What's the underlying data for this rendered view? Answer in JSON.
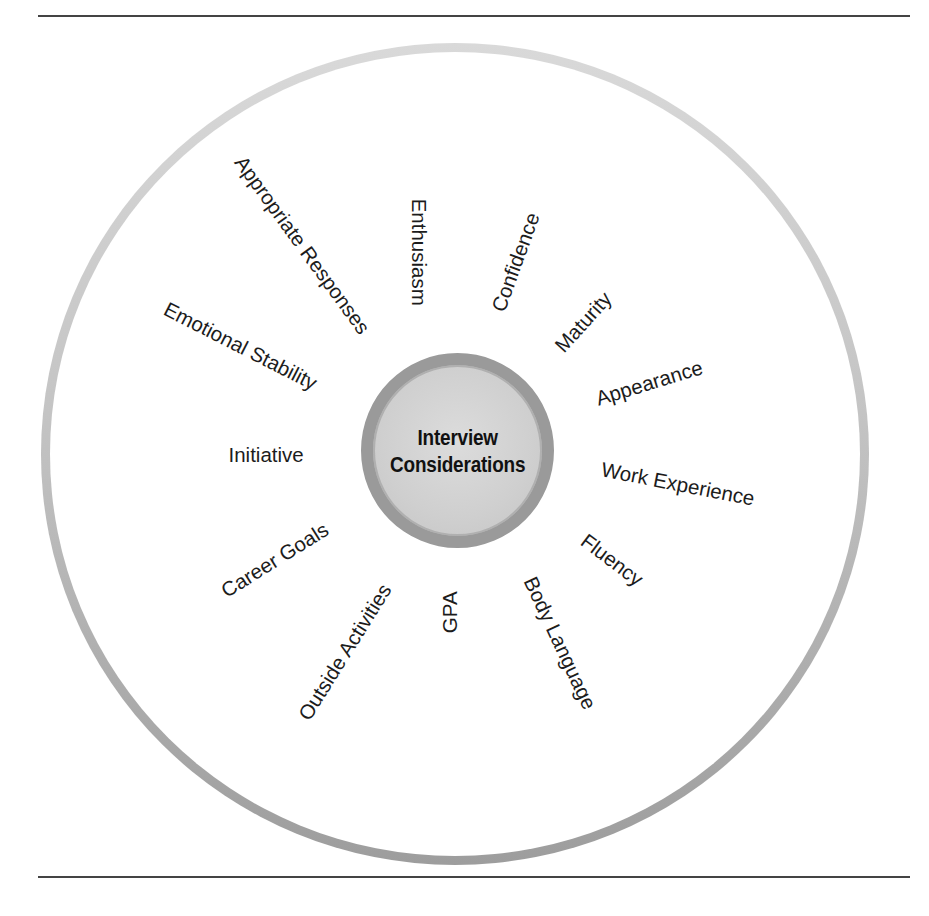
{
  "figure": {
    "caption_clipped": true,
    "hub": {
      "line1": "Interview",
      "line2": "Considerations"
    },
    "factors": [
      {
        "label": "Appropriate Responses",
        "cx": 302,
        "cy": 245,
        "angle": 54
      },
      {
        "label": "Enthusiasm",
        "cx": 418,
        "cy": 252,
        "angle": 90
      },
      {
        "label": "Confidence",
        "cx": 516,
        "cy": 262,
        "angle": -70
      },
      {
        "label": "Maturity",
        "cx": 583,
        "cy": 322,
        "angle": -48
      },
      {
        "label": "Appearance",
        "cx": 649,
        "cy": 383,
        "angle": -17
      },
      {
        "label": "Work Experience",
        "cx": 678,
        "cy": 484,
        "angle": 11
      },
      {
        "label": "Fluency",
        "cx": 612,
        "cy": 560,
        "angle": 37
      },
      {
        "label": "Body Language",
        "cx": 560,
        "cy": 643,
        "angle": 65
      },
      {
        "label": "GPA",
        "cx": 450,
        "cy": 612,
        "angle": -90
      },
      {
        "label": "Outside Activities",
        "cx": 345,
        "cy": 652,
        "angle": -58
      },
      {
        "label": "Career Goals",
        "cx": 275,
        "cy": 560,
        "angle": -32
      },
      {
        "label": "Initiative",
        "cx": 266,
        "cy": 455,
        "angle": 0
      },
      {
        "label": "Emotional Stability",
        "cx": 240,
        "cy": 346,
        "angle": 27
      }
    ]
  },
  "colors": {
    "rule": "#444444",
    "outer_ring_top": "#d9d9d9",
    "outer_ring_bottom": "#9d9d9d",
    "hub_border": "#9a9a9a",
    "hub_fill": "#d2d2d2",
    "text": "#1c1c1c"
  }
}
